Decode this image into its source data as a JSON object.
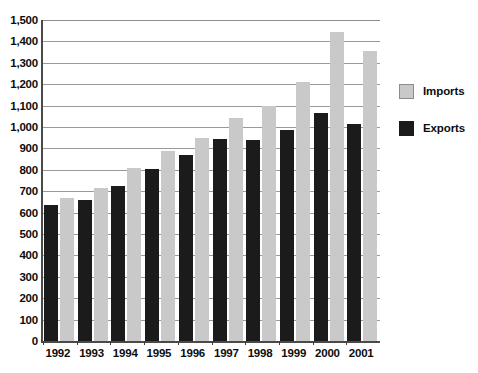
{
  "chart_data": {
    "type": "bar",
    "title": "",
    "subtitle": "",
    "xlabel": "",
    "ylabel": "",
    "categories": [
      "1992",
      "1993",
      "1994",
      "1995",
      "1996",
      "1997",
      "1998",
      "1999",
      "2000",
      "2001"
    ],
    "series": [
      {
        "name": "Exports",
        "color": "#1b1b1b",
        "values": [
          635,
          660,
          725,
          805,
          870,
          945,
          940,
          985,
          1065,
          1015
        ]
      },
      {
        "name": "Imports",
        "color": "#c9c9c9",
        "values": [
          670,
          715,
          810,
          890,
          950,
          1040,
          1100,
          1210,
          1445,
          1355
        ]
      }
    ],
    "ylim": [
      0,
      1500
    ],
    "ytick_step": 100,
    "ytick_labels": [
      "1,500",
      "1,400",
      "1,300",
      "1,200",
      "1,100",
      "1,000",
      "900",
      "800",
      "700",
      "600",
      "500",
      "400",
      "300",
      "200",
      "100",
      "0"
    ],
    "ytick_values": [
      1500,
      1400,
      1300,
      1200,
      1100,
      1000,
      900,
      800,
      700,
      600,
      500,
      400,
      300,
      200,
      100,
      0
    ],
    "grid": true,
    "grid_axis": "y",
    "legend_position": "right",
    "legend": [
      {
        "label": "Imports",
        "swatch": "imports"
      },
      {
        "label": "Exports",
        "swatch": "exports"
      }
    ]
  },
  "colors": {
    "background": "#ffffff",
    "axis": "#4a4a4a",
    "gridline": "#9a9a9a",
    "exports": "#1b1b1b",
    "imports": "#c9c9c9",
    "text": "#0d0d0d"
  }
}
